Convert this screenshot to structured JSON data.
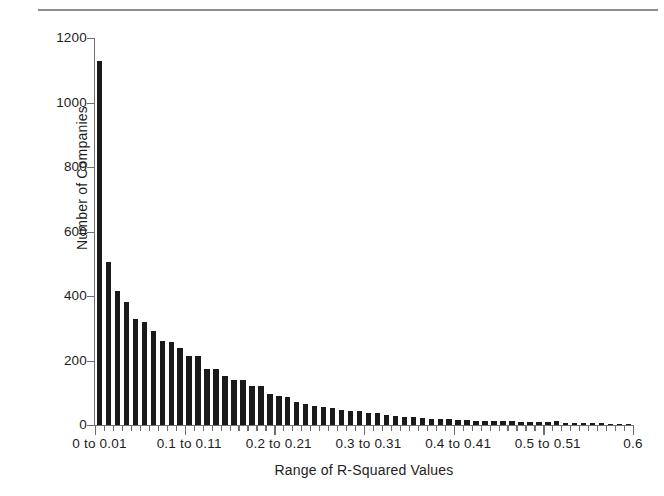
{
  "figure": {
    "top_rule": "horizontal-rule"
  },
  "chart_data": {
    "type": "bar",
    "title": "",
    "xlabel": "Range of R-Squared Values",
    "ylabel": "Number of Companies",
    "ylim": [
      0,
      1200
    ],
    "xlim": [
      0,
      0.6
    ],
    "grid": false,
    "legend": null,
    "bin_width": 0.01,
    "ytick_labels": [
      "0",
      "200",
      "400",
      "600",
      "800",
      "1000",
      "1200"
    ],
    "ytick_values": [
      0,
      200,
      400,
      600,
      800,
      1000,
      1200
    ],
    "xtick_labels": [
      "0 to 0.01",
      "0.1 to 0.11",
      "0.2 to 0.21",
      "0.3 to 0.31",
      "0.4 to 0.41",
      "0.5 to 0.51",
      "0.6"
    ],
    "xtick_positions": [
      0.005,
      0.105,
      0.205,
      0.305,
      0.405,
      0.505,
      0.6
    ],
    "categories": [
      "0 to 0.01",
      "0.01 to 0.02",
      "0.02 to 0.03",
      "0.03 to 0.04",
      "0.04 to 0.05",
      "0.05 to 0.06",
      "0.06 to 0.07",
      "0.07 to 0.08",
      "0.08 to 0.09",
      "0.09 to 0.1",
      "0.1 to 0.11",
      "0.11 to 0.12",
      "0.12 to 0.13",
      "0.13 to 0.14",
      "0.14 to 0.15",
      "0.15 to 0.16",
      "0.16 to 0.17",
      "0.17 to 0.18",
      "0.18 to 0.19",
      "0.19 to 0.2",
      "0.2 to 0.21",
      "0.21 to 0.22",
      "0.22 to 0.23",
      "0.23 to 0.24",
      "0.24 to 0.25",
      "0.25 to 0.26",
      "0.26 to 0.27",
      "0.27 to 0.28",
      "0.28 to 0.29",
      "0.29 to 0.3",
      "0.3 to 0.31",
      "0.31 to 0.32",
      "0.32 to 0.33",
      "0.33 to 0.34",
      "0.34 to 0.35",
      "0.35 to 0.36",
      "0.36 to 0.37",
      "0.37 to 0.38",
      "0.38 to 0.39",
      "0.39 to 0.4",
      "0.4 to 0.41",
      "0.41 to 0.42",
      "0.42 to 0.43",
      "0.43 to 0.44",
      "0.44 to 0.45",
      "0.45 to 0.46",
      "0.46 to 0.47",
      "0.47 to 0.48",
      "0.48 to 0.49",
      "0.49 to 0.5",
      "0.5 to 0.51",
      "0.51 to 0.52",
      "0.52 to 0.53",
      "0.53 to 0.54",
      "0.54 to 0.55",
      "0.55 to 0.56",
      "0.56 to 0.57",
      "0.57 to 0.58",
      "0.58 to 0.59",
      "0.59 to 0.6"
    ],
    "values": [
      1130,
      505,
      415,
      380,
      330,
      320,
      290,
      262,
      258,
      240,
      215,
      213,
      175,
      175,
      152,
      140,
      140,
      120,
      120,
      95,
      90,
      88,
      72,
      66,
      60,
      55,
      52,
      46,
      42,
      42,
      38,
      36,
      30,
      28,
      26,
      24,
      22,
      20,
      19,
      18,
      16,
      15,
      14,
      13,
      12,
      11,
      11,
      10,
      9,
      9,
      8,
      12,
      7,
      6,
      6,
      5,
      5,
      4,
      4,
      3
    ],
    "series": [
      {
        "name": "Number of Companies",
        "color": "#1a1a1a"
      }
    ],
    "colors": {
      "bar": "#1a1a1a",
      "axis": "#6e6e6e",
      "text": "#1d1d1d",
      "rule": "#8e8e8e",
      "background": "#ffffff"
    }
  }
}
